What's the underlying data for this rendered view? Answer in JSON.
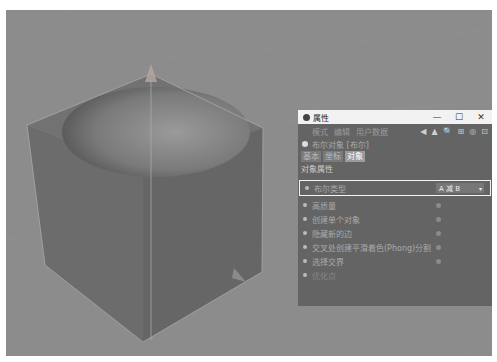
{
  "viewport": {
    "background": "#8c8c8c",
    "scene": {
      "object": "boolean-cube-with-sphere",
      "cube_color": "#6e6e6e",
      "sphere_color": "#7e7e7e"
    }
  },
  "panel": {
    "title": "属性",
    "window_controls": {
      "minimize": "—",
      "maximize": "☐",
      "close": "✕"
    },
    "menu": [
      "模式",
      "编辑",
      "用户数据"
    ],
    "tool_icons": [
      "◀",
      "▲",
      "🔍",
      "⊞",
      "◎",
      "⊡"
    ],
    "object_label": "布尔对象 [布尔]",
    "tabs": [
      {
        "label": "基本",
        "active": false
      },
      {
        "label": "坐标",
        "active": false
      },
      {
        "label": "对象",
        "active": true
      }
    ],
    "section_title": "对象属性",
    "params": [
      {
        "label": "布尔类型",
        "value": "A 减 B",
        "highlight": true
      },
      {
        "label": "高质量",
        "value": ""
      },
      {
        "label": "创建单个对象",
        "value": ""
      },
      {
        "label": "隐藏新的边",
        "value": ""
      },
      {
        "label": "交叉处创建平滑着色(Phong)分割",
        "value": ""
      },
      {
        "label": "选择交界",
        "value": ""
      },
      {
        "label": "优化点",
        "value": "",
        "faded": true
      }
    ]
  }
}
